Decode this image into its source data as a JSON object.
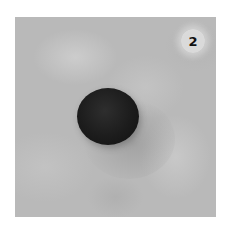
{
  "image": {
    "description": "Photo of a black round ball on a grey mottled stone surface, step illustration",
    "step_badge": {
      "label": "2"
    },
    "colors": {
      "background": "#ffffff",
      "surface": "#b9b9b9",
      "ball": "#1c1c1c",
      "badge": "#e1e1e1"
    }
  }
}
